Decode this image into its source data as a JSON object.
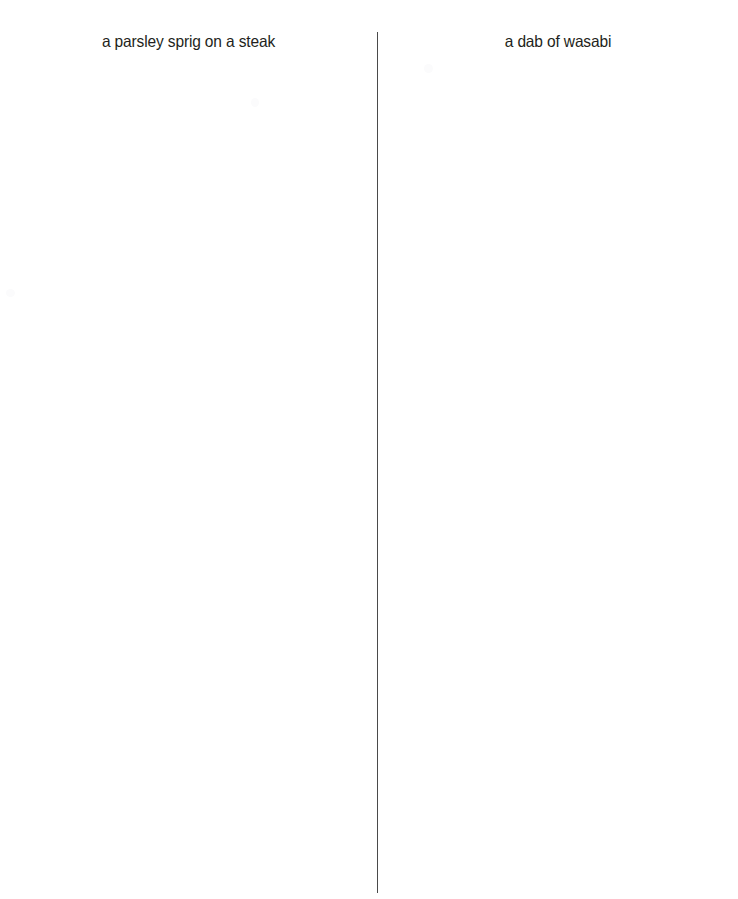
{
  "layout": {
    "type": "side-by-side-image-comparison",
    "width": 738,
    "height": 899,
    "background_color": "#ffffff",
    "divider_color": "#4a4a4a",
    "text_color": "#231f20"
  },
  "panels": [
    {
      "id": "left",
      "caption": "a parsley sprig on a steak",
      "image_content": ""
    },
    {
      "id": "right",
      "caption": "a dab of wasabi",
      "image_content": ""
    }
  ]
}
